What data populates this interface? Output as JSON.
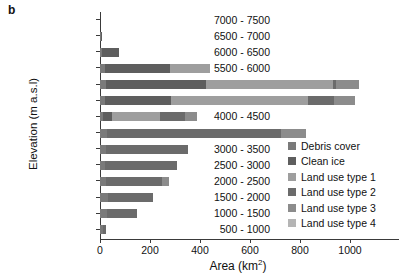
{
  "panel": {
    "label": "b"
  },
  "axes": {
    "ylabel": "Elevation (m a.s.l)",
    "xlabel_main": "Area (km",
    "xlabel_sup": "2",
    "xlabel_close": ")",
    "xlabel_full": "Area (km2)"
  },
  "colors": {
    "debris_cover": "#7a7a7a",
    "clean_ice": "#5e5e5e",
    "land_use_type_1": "#9e9e9e",
    "land_use_type_2": "#6b6b6b",
    "land_use_type_3": "#8c8c8c",
    "land_use_type_4": "#b5b5b5",
    "axis": "#3a3a3a",
    "text": "#111111",
    "background": "#ffffff"
  },
  "legend": {
    "position": "right-middle",
    "items": [
      {
        "label": "Debris cover",
        "color": "#7a7a7a",
        "key": "debris_cover"
      },
      {
        "label": "Clean ice",
        "color": "#5e5e5e",
        "key": "clean_ice"
      },
      {
        "label": "Land use type 1",
        "color": "#9e9e9e",
        "key": "land_use_type_1"
      },
      {
        "label": "Land use type 2",
        "color": "#6b6b6b",
        "key": "land_use_type_2"
      },
      {
        "label": "Land use type 3",
        "color": "#8c8c8c",
        "key": "land_use_type_3"
      },
      {
        "label": "Land use type 4",
        "color": "#b5b5b5",
        "key": "land_use_type_4"
      }
    ]
  },
  "chart_data": {
    "type": "bar",
    "orientation": "horizontal",
    "stacked": true,
    "title": "",
    "xlabel": "Area (km2)",
    "ylabel": "Elevation (m a.s.l)",
    "xlim": [
      0,
      1100
    ],
    "ylim": [
      0,
      15
    ],
    "grid": false,
    "legend_position": "right-middle",
    "xticks": [
      0,
      200,
      400,
      600,
      800,
      1000
    ],
    "categories": [
      "7000 - 7500",
      "6500 - 7000",
      "6000 - 6500",
      "5500 - 6000",
      "5000 - 5500",
      "4500 - 5000",
      "4000 - 4500",
      "3500 - 4000",
      "3000 - 3500",
      "2500 - 3000",
      "2000 - 2500",
      "1500 - 2000",
      "1000 - 1500",
      "500 - 1000"
    ],
    "series": [
      {
        "name": "Debris cover",
        "color": "#7a7a7a",
        "values": [
          0,
          2,
          8,
          18,
          22,
          20,
          12,
          28,
          22,
          18,
          22,
          30,
          28,
          10
        ]
      },
      {
        "name": "Clean ice",
        "color": "#5e5e5e",
        "values": [
          0,
          6,
          68,
          260,
          400,
          265,
          34,
          0,
          0,
          0,
          0,
          0,
          0,
          0
        ]
      },
      {
        "name": "Land use type 1",
        "color": "#9e9e9e",
        "values": [
          0,
          0,
          0,
          160,
          510,
          545,
          195,
          0,
          0,
          0,
          0,
          0,
          0,
          0
        ]
      },
      {
        "name": "Land use type 2",
        "color": "#6b6b6b",
        "values": [
          0,
          0,
          0,
          0,
          10,
          105,
          100,
          695,
          330,
          290,
          225,
          180,
          120,
          12
        ]
      },
      {
        "name": "Land use type 3",
        "color": "#8c8c8c",
        "values": [
          0,
          0,
          0,
          0,
          95,
          85,
          45,
          100,
          0,
          0,
          30,
          0,
          0,
          0
        ]
      },
      {
        "name": "Land use type 4",
        "color": "#b5b5b5",
        "values": [
          0,
          0,
          0,
          0,
          0,
          0,
          0,
          0,
          0,
          0,
          0,
          0,
          0,
          0
        ]
      }
    ],
    "totals": [
      0,
      8,
      76,
      438,
      1037,
      1020,
      386,
      823,
      352,
      308,
      277,
      210,
      148,
      22
    ]
  }
}
